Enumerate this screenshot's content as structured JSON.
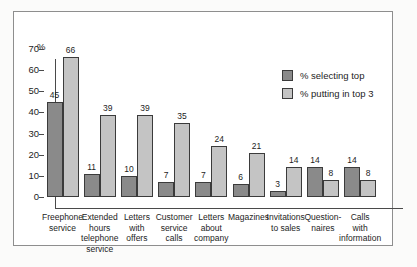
{
  "chart_data": {
    "type": "bar",
    "title": "",
    "xlabel": "",
    "ylabel": "%",
    "ylim": [
      0,
      70
    ],
    "yticks": [
      0,
      10,
      20,
      30,
      40,
      50,
      60,
      70
    ],
    "grid": false,
    "legend_position": "top-right",
    "categories": [
      "Freephone\nservice",
      "Extended\nhours\ntelephone\nservice",
      "Letters\nwith\noffers",
      "Customer\nservice\ncalls",
      "Letters\nabout\ncompany",
      "Magazines",
      "Invitations\nto sales",
      "Question-\nnaires",
      "Calls\nwith\ninformation"
    ],
    "series": [
      {
        "name": "% selecting top",
        "color": "#8a8a8a",
        "values": [
          45,
          11,
          10,
          7,
          7,
          6,
          3,
          14,
          14
        ]
      },
      {
        "name": "% putting in top 3",
        "color": "#c4c4c4",
        "values": [
          66,
          39,
          39,
          35,
          24,
          21,
          14,
          8,
          8
        ]
      }
    ]
  },
  "legend": {
    "items": [
      {
        "label": "% selecting top",
        "color": "#8a8a8a"
      },
      {
        "label": "% putting in top 3",
        "color": "#c4c4c4"
      }
    ]
  }
}
